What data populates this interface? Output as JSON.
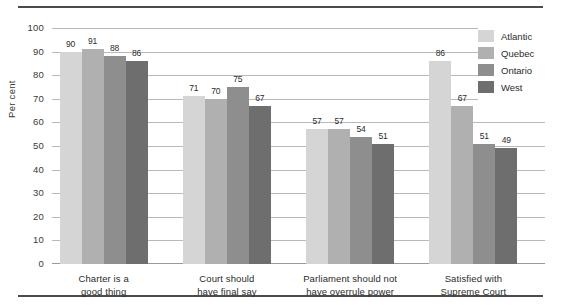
{
  "chart_data": {
    "type": "bar",
    "title": "",
    "xlabel": "",
    "ylabel": "Per cent",
    "ylim": [
      0,
      100
    ],
    "ytick_step": 10,
    "yticks": [
      "100",
      "90",
      "80",
      "70",
      "60",
      "50",
      "40",
      "30",
      "20",
      "10",
      "0"
    ],
    "grid": true,
    "legend_position": "top-right",
    "categories": [
      "Charter is a good thing",
      "Court should have final say",
      "Parliament should not have overrule power",
      "Satisfied with Supreme Court"
    ],
    "category_lines": [
      [
        "Charter is a",
        "good thing"
      ],
      [
        "Court should",
        "have final say"
      ],
      [
        "Parliament should not",
        "have overrule power"
      ],
      [
        "Satisfied with",
        "Supreme Court"
      ]
    ],
    "series": [
      {
        "name": "Atlantic",
        "color": "#d5d5d5",
        "values": [
          90,
          71,
          57,
          86
        ]
      },
      {
        "name": "Quebec",
        "color": "#b0b0b0",
        "values": [
          91,
          70,
          57,
          67
        ]
      },
      {
        "name": "Ontario",
        "color": "#8e8e8e",
        "values": [
          88,
          75,
          54,
          51
        ]
      },
      {
        "name": "West",
        "color": "#6e6e6e",
        "values": [
          86,
          67,
          51,
          49
        ]
      }
    ]
  },
  "colors": {
    "rule": "#4b4b4b",
    "gridline": "#b9b9b9",
    "text": "#2b2b2b"
  }
}
